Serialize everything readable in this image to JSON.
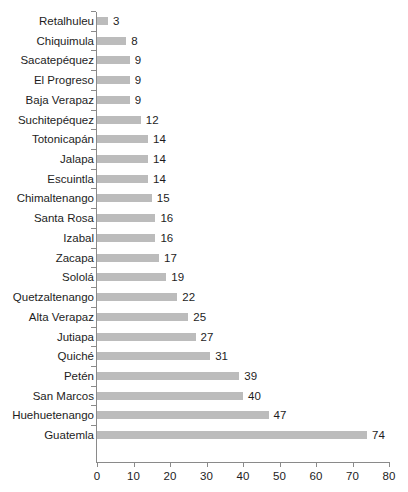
{
  "chart_data": {
    "type": "bar",
    "orientation": "horizontal",
    "title": "",
    "subtitle": "",
    "xlabel": "",
    "ylabel": "",
    "xlim": [
      0,
      80
    ],
    "xticks": [
      0,
      10,
      20,
      30,
      40,
      50,
      60,
      70,
      80
    ],
    "grid": false,
    "legend": null,
    "show_value_labels": true,
    "bar_color": "#bcbcbc",
    "axis_color": "#8a8a8a",
    "text_color": "#1d1d1d",
    "categories": [
      "Retalhuleu",
      "Chiquimula",
      "Sacatepéquez",
      "El Progreso",
      "Baja Verapaz",
      "Suchitepéquez",
      "Totonicapán",
      "Jalapa",
      "Escuintla",
      "Chimaltenango",
      "Santa Rosa",
      "Izabal",
      "Zacapa",
      "Sololá",
      "Quetzaltenango",
      "Alta Verapaz",
      "Jutiapa",
      "Quiché",
      "Petén",
      "San Marcos",
      "Huehuetenango",
      "Guatemla"
    ],
    "values": [
      3,
      8,
      9,
      9,
      9,
      12,
      14,
      14,
      14,
      15,
      16,
      16,
      17,
      19,
      22,
      25,
      27,
      31,
      39,
      40,
      47,
      74
    ]
  }
}
